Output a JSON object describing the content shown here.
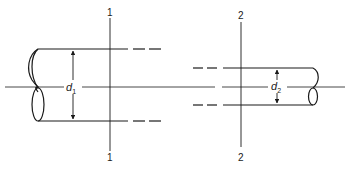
{
  "diagram": {
    "type": "pipe-contraction-sections",
    "colors": {
      "line": "#1a1a1a",
      "background": "#ffffff"
    },
    "centerline": {
      "y": 87
    },
    "section_1": {
      "label_top": "1",
      "label_bottom": "1",
      "x": 110
    },
    "section_2": {
      "label_top": "2",
      "label_bottom": "2",
      "x": 241
    },
    "pipe_1": {
      "diameter_label": "d",
      "diameter_subscript": "1",
      "top_y": 49,
      "bottom_y": 121
    },
    "pipe_2": {
      "diameter_label": "d",
      "diameter_subscript": "2",
      "top_y": 68,
      "bottom_y": 105
    }
  }
}
